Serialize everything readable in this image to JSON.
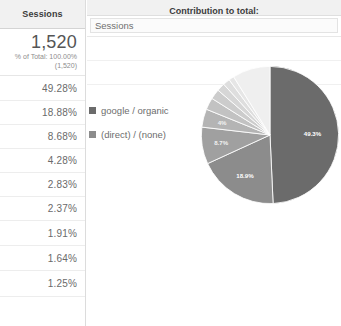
{
  "widget": {
    "left_column_header": "Sessions",
    "contribution_header": "Contribution to total:",
    "metric_selected": "Sessions",
    "metric_options": [
      "Sessions"
    ]
  },
  "summary": {
    "total_value": "1,520",
    "percent_of_total_label": "% of Total:  100.00%",
    "percent_of_total_paren": "(1,520)"
  },
  "rows": [
    {
      "percent": "49.28%",
      "legend": "google / organic",
      "swatch": "#6b6b6b"
    },
    {
      "percent": "18.88%",
      "legend": "(direct) / (none)",
      "swatch": "#8c8c8c"
    },
    {
      "percent": "8.68%",
      "legend": "",
      "swatch": "#a0a0a0"
    },
    {
      "percent": "4.28%",
      "legend": "",
      "swatch": "#b4b4b4"
    },
    {
      "percent": "2.83%",
      "legend": "",
      "swatch": "#c2c2c2"
    },
    {
      "percent": "2.37%",
      "legend": "",
      "swatch": "#cccccc"
    },
    {
      "percent": "1.91%",
      "legend": "",
      "swatch": "#d6d6d6"
    },
    {
      "percent": "1.64%",
      "legend": "",
      "swatch": "#dedede"
    },
    {
      "percent": "1.25%",
      "legend": "",
      "swatch": "#e6e6e6"
    }
  ],
  "chart_data": {
    "type": "pie",
    "title": "Contribution to total: Sessions",
    "metric": "Sessions",
    "total": 1520,
    "legend_position": "left",
    "labels": [
      "google / organic",
      "(direct) / (none)",
      "slice-3",
      "slice-4",
      "slice-5",
      "slice-6",
      "slice-7",
      "slice-8",
      "slice-9",
      "other"
    ],
    "values": [
      49.28,
      18.88,
      8.68,
      4.28,
      2.83,
      2.37,
      1.91,
      1.64,
      1.25,
      8.88
    ],
    "value_unit": "percent",
    "colors": [
      "#6b6b6b",
      "#8c8c8c",
      "#a0a0a0",
      "#b4b4b4",
      "#c2c2c2",
      "#cccccc",
      "#d6d6d6",
      "#dedede",
      "#e6e6e6",
      "#efefef"
    ],
    "slice_labels_shown": [
      {
        "text": "49.3%",
        "value": 49.28
      },
      {
        "text": "18.9%",
        "value": 18.88
      },
      {
        "text": "8.7%",
        "value": 8.68
      },
      {
        "text": "4%",
        "value": 4.28
      }
    ]
  },
  "colors": {
    "header_bg": "#f1f1f1",
    "border": "#dcdcdc",
    "text": "#6a6a6a",
    "accent_slice": "#6b6b6b"
  }
}
